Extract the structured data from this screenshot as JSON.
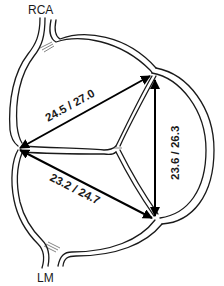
{
  "diagram": {
    "type": "aortic-valve-schematic",
    "labels": {
      "top_vessel": "RCA",
      "bottom_vessel": "LM"
    },
    "measurements": [
      {
        "id": "top-left",
        "label": "24.5 / 27.0",
        "from": "left-commissure",
        "to": "top-right-commissure"
      },
      {
        "id": "right",
        "label": "23.6 / 26.3",
        "from": "bottom-right-commissure",
        "to": "top-right-commissure"
      },
      {
        "id": "bottom-left",
        "label": "23.2 / 24.7",
        "from": "left-commissure",
        "to": "bottom-right-commissure"
      }
    ],
    "colors": {
      "line": "#1a1a1a",
      "background": "#ffffff",
      "arrow": "#000000"
    }
  }
}
